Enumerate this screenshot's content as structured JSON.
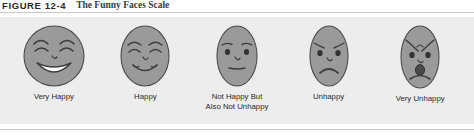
{
  "caption": {
    "number": "FIGURE 12-4",
    "title": "The Funny Faces Scale"
  },
  "colors": {
    "panel_background": "#ededed",
    "face_fill": "#9a9a9a",
    "face_stroke": "#4a4a4a",
    "rule": "#c9c9c9",
    "label_text": "#2a2a2a",
    "caption_number_text": "#2b2b2b",
    "caption_title_text": "#3a3a3a"
  },
  "scale": {
    "items": [
      {
        "label": "Very Happy",
        "expression": "very-happy",
        "icon": "very-happy-face-icon",
        "position": 1
      },
      {
        "label": "Happy",
        "expression": "happy",
        "icon": "happy-face-icon",
        "position": 2
      },
      {
        "label": "Not Happy But\nAlso Not Unhappy",
        "expression": "neutral",
        "icon": "neutral-face-icon",
        "position": 3
      },
      {
        "label": "Unhappy",
        "expression": "unhappy",
        "icon": "unhappy-face-icon",
        "position": 4
      },
      {
        "label": "Very Unhappy",
        "expression": "very-unhappy",
        "icon": "very-unhappy-face-icon",
        "position": 5
      }
    ]
  }
}
